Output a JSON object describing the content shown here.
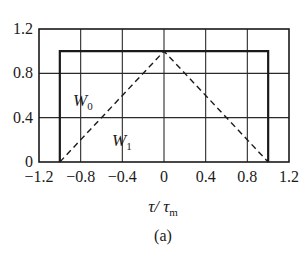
{
  "chart_data": {
    "type": "line",
    "title": "",
    "caption": "(a)",
    "xlabel": "τ/τm",
    "xlabel_main": "τ/ τ",
    "xlabel_sub": "m",
    "ylabel": "",
    "xlim": [
      -1.2,
      1.2
    ],
    "ylim": [
      0,
      1.2
    ],
    "grid": true,
    "x_ticks": [
      -1.2,
      -0.8,
      -0.4,
      0,
      0.4,
      0.8,
      1.2
    ],
    "x_tick_labels": [
      "−1.2",
      "−0.8",
      "−0.4",
      "0",
      "0.4",
      "0.8",
      "1.2"
    ],
    "y_ticks": [
      0,
      0.4,
      0.8,
      1.2
    ],
    "y_tick_labels": [
      "0",
      "0.4",
      "0.8",
      "1.2"
    ],
    "series": [
      {
        "name": "W0",
        "label_main": "W",
        "label_sub": "0",
        "style": "solid",
        "x": [
          -1.0,
          -1.0,
          1.0,
          1.0
        ],
        "y": [
          0,
          1.0,
          1.0,
          0
        ]
      },
      {
        "name": "W1",
        "label_main": "W",
        "label_sub": "1",
        "style": "dashed",
        "x": [
          -1.0,
          0,
          1.0
        ],
        "y": [
          0,
          1.0,
          0
        ]
      }
    ],
    "legend": "inline labels inside plot (W0 near rectangle, W1 near triangle)",
    "colors": {
      "line": "#1a1a1a",
      "grid": "#2a2a2a",
      "background": "#ffffff"
    }
  }
}
